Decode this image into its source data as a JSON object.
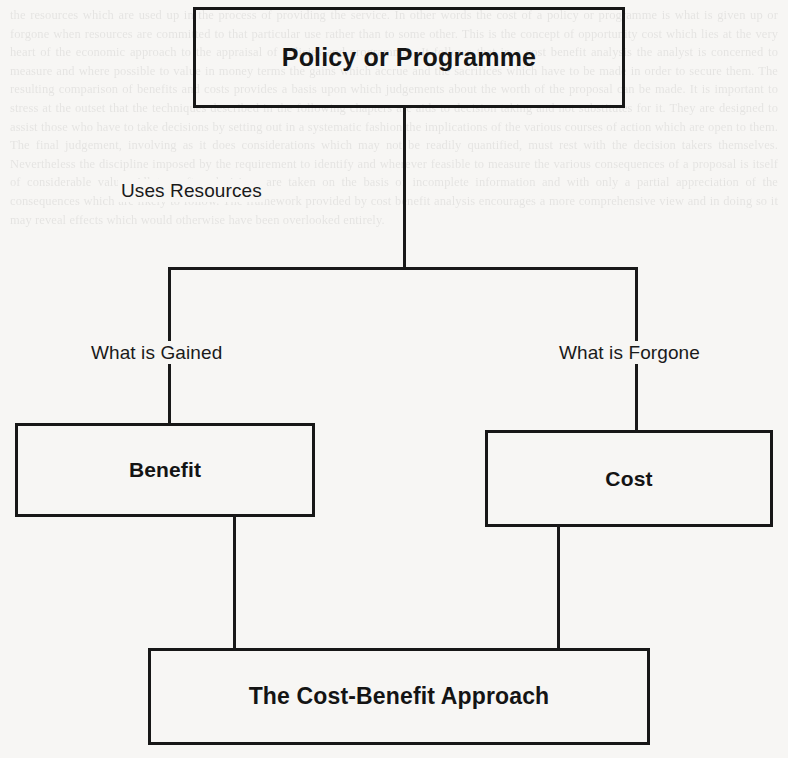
{
  "diagram": {
    "nodes": {
      "policy": {
        "label": "Policy or Programme"
      },
      "benefit": {
        "label": "Benefit"
      },
      "cost": {
        "label": "Cost"
      },
      "approach": {
        "label": "The Cost-Benefit Approach"
      }
    },
    "edge_labels": {
      "uses_resources": "Uses Resources",
      "what_is_gained": "What is Gained",
      "what_is_forgone": "What is Forgone"
    },
    "colors": {
      "line": "#191919",
      "text": "#141414",
      "page_background": "#f7f6f4"
    }
  },
  "background_bleedthrough": {
    "text": "the resources which are used up in the process of providing the service. In other words the cost of a policy or programme is what is given up or forgone when resources are committed to that particular use rather than to some other. This is the concept of opportunity cost which lies at the very heart of the economic approach to the appraisal of policies and programmes. It follows that in a cost benefit analysis the analyst is concerned to measure and where possible to value in money terms the gains which accrue and the sacrifices which have to be made in order to secure them. The resulting comparison of benefits and costs provides a basis upon which judgements about the worth of the proposal can be made. It is important to stress at the outset that the techniques described in the following chapters are aids to decision taking and not substitutes for it. They are designed to assist those who have to take decisions by setting out in a systematic fashion the implications of the various courses of action which are open to them. The final judgement, involving as it does considerations which may not be readily quantified, must rest with the decision takers themselves. Nevertheless the discipline imposed by the requirement to identify and wherever feasible to measure the various consequences of a proposal is itself of considerable value. All too often decisions are taken on the basis of incomplete information and with only a partial appreciation of the consequences which are likely to follow. The framework provided by cost benefit analysis encourages a more comprehensive view and in doing so it may reveal effects which would otherwise have been overlooked entirely."
  }
}
